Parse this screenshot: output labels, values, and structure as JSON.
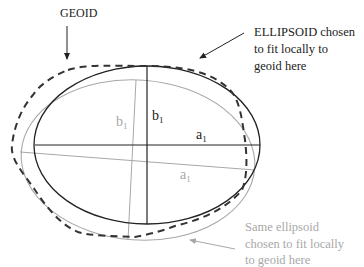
{
  "diagram": {
    "labels": {
      "geoid": "GEOID",
      "ellipsoid_line1": "ELLIPSOID chosen",
      "ellipsoid_line2": "to fit locally to",
      "ellipsoid_line3": "geoid here",
      "same_line1": "Same ellipsoid",
      "same_line2": "chosen to fit locally",
      "same_line3": "to geoid here",
      "dark_b": "b",
      "dark_b_sub": "1",
      "dark_a": "a",
      "dark_a_sub": "1",
      "gray_b": "b",
      "gray_b_sub": "1",
      "gray_a": "a",
      "gray_a_sub": "1"
    },
    "colors": {
      "dark": "#222222",
      "gray": "#a8a8a8",
      "geoid_dash": "#333333"
    },
    "nodes": [
      {
        "id": "geoid",
        "type": "dashed-curve",
        "label": "GEOID"
      },
      {
        "id": "ellipsoid-1",
        "type": "ellipse",
        "style": "dark",
        "semi_major": "a1",
        "semi_minor": "b1"
      },
      {
        "id": "ellipsoid-2",
        "type": "ellipse",
        "style": "gray-tilted",
        "semi_major": "a1",
        "semi_minor": "b1"
      }
    ],
    "edges": [
      {
        "from": "GEOID label",
        "to": "geoid",
        "type": "arrow"
      },
      {
        "from": "ELLIPSOID label",
        "to": "ellipsoid-1 (top-right)",
        "type": "arrow"
      },
      {
        "from": "Same ellipsoid label",
        "to": "ellipsoid-2 (bottom-right)",
        "type": "arrow"
      }
    ]
  }
}
